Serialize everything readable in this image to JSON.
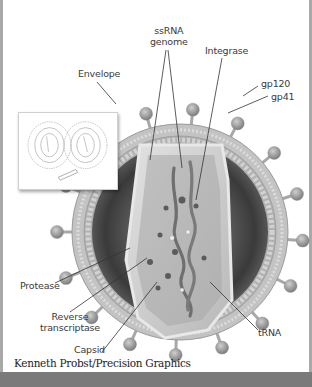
{
  "figure": {
    "labels": {
      "ssrna_line1": "ssRNA",
      "ssrna_line2": "genome",
      "integrase": "Integrase",
      "envelope": "Envelope",
      "gp120": "gp120",
      "gp41": "gp41",
      "protease": "Protease",
      "reverse_transcriptase_line1": "Reverse",
      "reverse_transcriptase_line2": "transcriptase",
      "trna": "tRNA",
      "capsid": "Capsid"
    },
    "credit": "Kenneth Probst/Precision Graphics",
    "inset": {
      "description": "Line-art of two budding virions (cross-section outline)"
    }
  },
  "colors": {
    "background": "#ffffff",
    "border": "#a9a9a9",
    "bottom_band": "#7a7a7a",
    "envelope": "#b9b9b9",
    "spike": "#9c9c9c",
    "matrix_dark": "#3c3c3c",
    "capsid": "#cfcfcf",
    "leader_line": "#333333"
  }
}
